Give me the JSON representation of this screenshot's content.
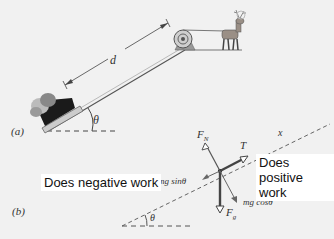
{
  "panel_a": {
    "label": "(a)",
    "distance_label": "d",
    "angle_label": "θ"
  },
  "panel_b": {
    "label": "(b)",
    "angle_label": "θ",
    "axis_label": "x",
    "forces": {
      "normal": "F",
      "normal_sub": "N",
      "tension": "T",
      "gravity": "F",
      "gravity_sub": "g",
      "parallel_component": "mg sinθ",
      "perpendicular_component": "mg cosθ"
    },
    "annotations": {
      "negative_work": "Does negative work",
      "positive_work_line1": "Does",
      "positive_work_line2": "positive work"
    }
  },
  "colors": {
    "background": "#f1f1f1",
    "line": "#444444",
    "arrow": "#555555",
    "incline": "#888888"
  }
}
